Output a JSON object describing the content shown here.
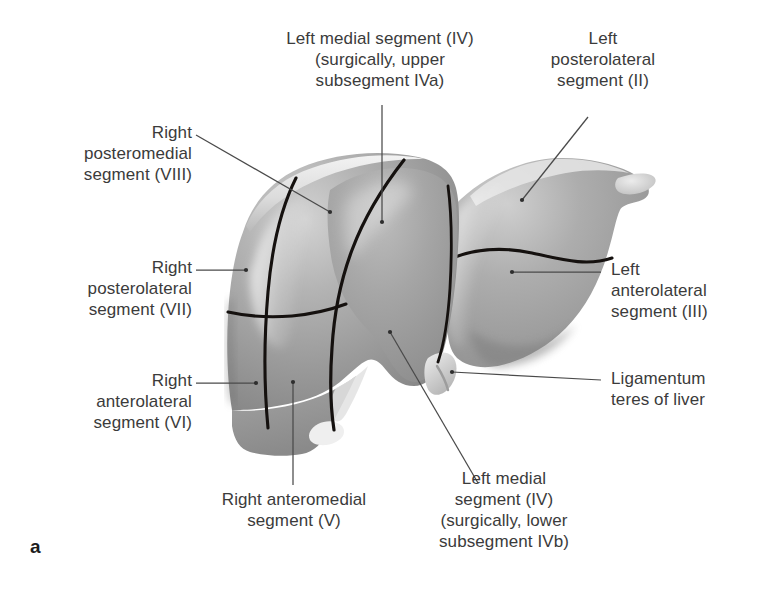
{
  "figure": {
    "letter": "a",
    "title_hidden": "",
    "colors": {
      "label_text": "#3b3b3b",
      "leader_line": "#4a4a4a",
      "fissure_line": "#111111",
      "liver_mid": "#9a9a9a",
      "liver_light": "#d8d8d8",
      "liver_dark": "#6f6f6f",
      "background": "#ffffff"
    }
  },
  "labels": {
    "right_posteromedial": {
      "lines": "Right\npostero­medial\nsegment (VIII)",
      "text": "Right\nposteromedial\nsegment (VIII)",
      "segment": "VIII"
    },
    "right_posterolateral": {
      "text": "Right\nposterolateral\nsegment (VII)",
      "segment": "VII"
    },
    "right_anterolateral": {
      "text": "Right\nanterolateral\nsegment (VI)",
      "segment": "VI"
    },
    "right_anteromedial": {
      "text": "Right anteromedial\nsegment (V)",
      "segment": "V"
    },
    "left_medial_upper": {
      "text": "Left medial segment (IV)\n(surgically, upper\nsubsegment IVa)",
      "segment": "IVa"
    },
    "left_medial_lower": {
      "text": "Left medial\nsegment (IV)\n(surgically, lower\nsubsegment IVb)",
      "segment": "IVb"
    },
    "left_posterolateral": {
      "text": "Left\nposterolateral\nsegment (II)",
      "segment": "II"
    },
    "left_anterolateral": {
      "text": "Left\nanterolateral\nsegment (III)",
      "segment": "III"
    },
    "ligamentum_teres": {
      "text": "Ligamentum\nteres of liver",
      "segment": ""
    }
  }
}
